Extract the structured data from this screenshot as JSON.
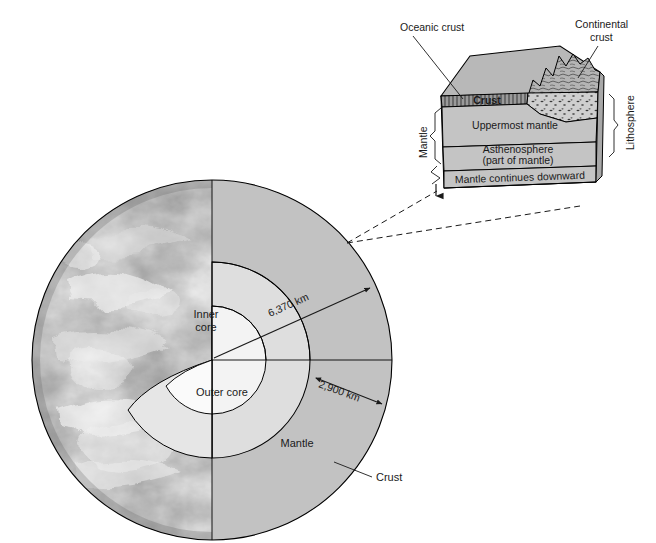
{
  "figure": {
    "background_color": "#ffffff"
  },
  "globe": {
    "name": "earth-cutaway-globe",
    "labels": {
      "inner_core": "Inner\ncore",
      "inner_core_line1": "Inner",
      "inner_core_line2": "core",
      "outer_core": "Outer core",
      "mantle": "Mantle",
      "crust": "Crust"
    },
    "dimensions": [
      {
        "id": "radius-total",
        "value": "6,370 km",
        "describes": "Earth radius from center to surface"
      },
      {
        "id": "depth-core-mantle",
        "value": "2,900 km",
        "describes": "Depth to core-mantle boundary"
      }
    ],
    "colors": {
      "mantle_fill": "#c4c4c4",
      "wedge_face_fill": "#8f8f8f",
      "outer_core_fill": "#dcdcdc",
      "inner_core_fill": "#f2f2f2",
      "outline": "#000000"
    }
  },
  "inset": {
    "name": "lithosphere-block-diagram",
    "external_labels": [
      {
        "id": "oceanic-crust",
        "text": "Oceanic crust",
        "lines": [
          "Oceanic crust"
        ]
      },
      {
        "id": "continental-crust",
        "text": "Continental crust",
        "lines": [
          "Continental",
          "crust"
        ]
      }
    ],
    "bracket_labels": [
      {
        "id": "mantle-bracket",
        "text": "Mantle",
        "side": "left",
        "orientation": "vertical"
      },
      {
        "id": "lithosphere-bracket",
        "text": "Lithosphere",
        "side": "right",
        "orientation": "vertical"
      }
    ],
    "layers": [
      {
        "id": "crust-layer",
        "text": "Crust",
        "texture": "vertical-hatch"
      },
      {
        "id": "uppermost-mantle-layer",
        "text": "Uppermost mantle",
        "texture": "solid"
      },
      {
        "id": "asthenosphere-layer",
        "lines": [
          "Asthenosphere",
          "(part of mantle)"
        ],
        "texture": "solid"
      },
      {
        "id": "deep-mantle-layer",
        "text": "Mantle continues downward",
        "texture": "solid"
      }
    ],
    "colors": {
      "block_top_fill": "#b8b8b8",
      "block_face_fill": "#c4c4c4",
      "block_side_fill": "#a8a8a8",
      "crust_fill": "#9a9a9a",
      "continental_fill": "#cfcfcf",
      "mountain_fill": "#b0b0b0",
      "outline": "#000000"
    }
  },
  "connectors": {
    "name": "inset-callout-dashed-lines",
    "style": "dashed",
    "count": 2,
    "description": "Dashed lines linking globe surface point to inset block"
  }
}
